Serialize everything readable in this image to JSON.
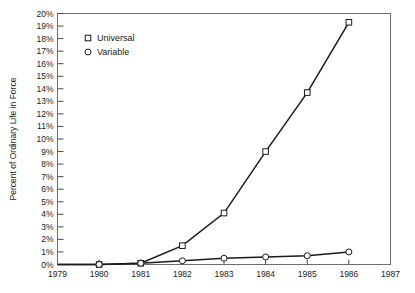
{
  "chart_data": {
    "type": "line",
    "title": "",
    "xlabel": "",
    "ylabel": "Percent of Ordinary Life in Force",
    "x": [
      1979,
      1980,
      1981,
      1982,
      1983,
      1984,
      1985,
      1986
    ],
    "xlim": [
      1979,
      1987
    ],
    "ylim": [
      0,
      20
    ],
    "grid": false,
    "legend_position": "top-left",
    "x_tick_labels": [
      "1979",
      "1980",
      "1981",
      "1982",
      "1983",
      "1984",
      "1985",
      "1986",
      "1987"
    ],
    "y_tick_labels": [
      "0%",
      "1%",
      "2%",
      "3%",
      "4%",
      "5%",
      "6%",
      "7%",
      "8%",
      "9%",
      "10%",
      "11%",
      "12%",
      "13%",
      "14%",
      "15%",
      "16%",
      "17%",
      "18%",
      "19%",
      "20%"
    ],
    "series": [
      {
        "name": "Universal",
        "marker": "square",
        "values": [
          0,
          0,
          0.1,
          1.5,
          4.1,
          9.0,
          13.7,
          19.3
        ]
      },
      {
        "name": "Variable",
        "marker": "circle",
        "values": [
          0,
          0,
          0.1,
          0.3,
          0.5,
          0.6,
          0.7,
          1.0
        ]
      }
    ]
  },
  "legend": {
    "entries": [
      {
        "label": "Universal",
        "marker": "square"
      },
      {
        "label": "Variable",
        "marker": "circle"
      }
    ]
  },
  "colors": {
    "line": "#1a1a1a",
    "frame": "#6e6e6e",
    "text": "#1a1a1a",
    "background": "#ffffff"
  }
}
